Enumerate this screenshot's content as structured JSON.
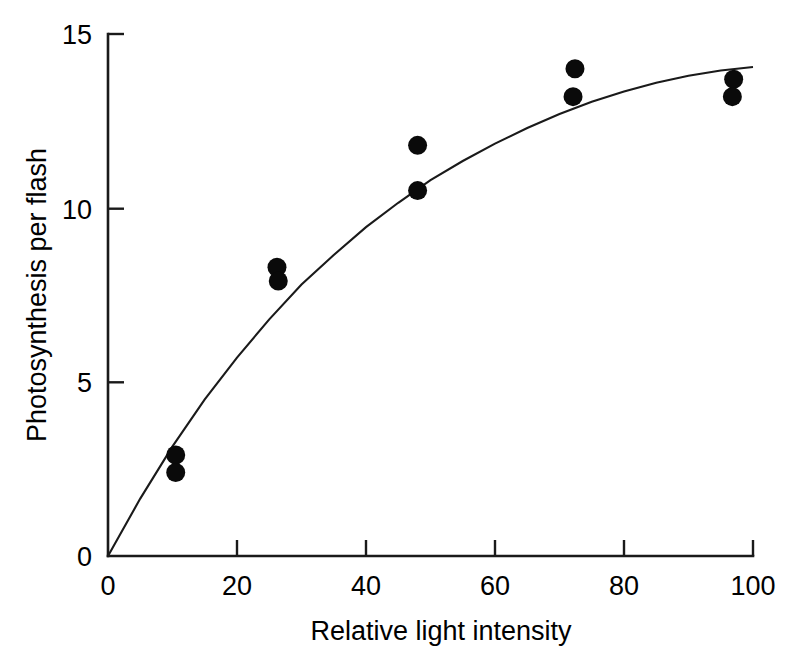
{
  "chart_data": {
    "type": "scatter",
    "title": "",
    "xlabel": "Relative light intensity",
    "ylabel": "Photosynthesis per flash",
    "xlim": [
      0,
      100
    ],
    "ylim": [
      0,
      15
    ],
    "xticks": [
      0,
      20,
      40,
      60,
      80,
      100
    ],
    "yticks": [
      0,
      5,
      10,
      15
    ],
    "xtick_labels": [
      "0",
      "20",
      "40",
      "60",
      "80",
      "100"
    ],
    "ytick_labels": [
      "0",
      "5",
      "10",
      "15"
    ],
    "grid": false,
    "legend": false,
    "legend_position": "none",
    "marker": "filled-circle",
    "marker_color": "#0a0a0a",
    "curve_color": "#1a1a1a",
    "axis_color": "#1a1a1a",
    "background_color": "#ffffff",
    "points": [
      {
        "x": 10.5,
        "y": 2.9
      },
      {
        "x": 10.5,
        "y": 2.4
      },
      {
        "x": 26.2,
        "y": 8.3
      },
      {
        "x": 26.4,
        "y": 7.9
      },
      {
        "x": 48.0,
        "y": 11.8
      },
      {
        "x": 48.0,
        "y": 10.5
      },
      {
        "x": 72.4,
        "y": 14.0
      },
      {
        "x": 72.1,
        "y": 13.2
      },
      {
        "x": 97.0,
        "y": 13.7
      },
      {
        "x": 96.8,
        "y": 13.2
      }
    ],
    "fit_curve": {
      "name": "saturating fit",
      "description": "rectangular hyperbola rising from origin to asymptote near 14",
      "x": [
        0,
        5,
        10,
        15,
        20,
        25,
        30,
        35,
        40,
        45,
        50,
        55,
        60,
        65,
        70,
        75,
        80,
        85,
        90,
        95,
        100
      ],
      "y": [
        0.0,
        1.65,
        3.15,
        4.5,
        5.7,
        6.8,
        7.8,
        8.65,
        9.45,
        10.15,
        10.8,
        11.35,
        11.85,
        12.3,
        12.7,
        13.05,
        13.35,
        13.6,
        13.8,
        13.95,
        14.05
      ]
    }
  },
  "figure": {
    "ytick_0": "0",
    "ytick_5": "5",
    "ytick_10": "10",
    "ytick_15": "15",
    "xtick_0": "0",
    "xtick_20": "20",
    "xtick_40": "40",
    "xtick_60": "60",
    "xtick_80": "80",
    "xtick_100": "100",
    "y_axis_title": "Photosynthesis per flash",
    "x_axis_title": "Relative light intensity"
  }
}
